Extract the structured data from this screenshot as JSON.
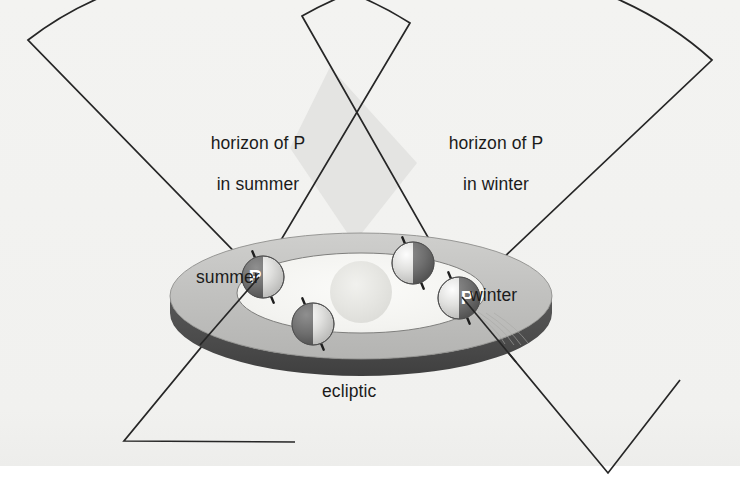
{
  "figure": {
    "background_color": "#f2f2f0",
    "page_color": "#ffffff",
    "line_color": "#262626"
  },
  "labels": {
    "horizon_summer_line1": "horizon of P",
    "horizon_summer_line2": "in summer",
    "horizon_winter_line1": "horizon of P",
    "horizon_winter_line2": "in winter",
    "summer": "summer",
    "winter": "winter",
    "ecliptic": "ecliptic",
    "observer_marker": "P"
  },
  "horizons": [
    {
      "name": "horizon-of-p-in-summer",
      "vertex_x": 259,
      "vertex_y": 277,
      "radius": 332,
      "start_angle_deg": 186,
      "end_angle_deg": 297,
      "fill": "none",
      "stroke": "#262626"
    },
    {
      "name": "horizon-of-p-in-winter",
      "vertex_x": 462,
      "vertex_y": 297,
      "radius": 352,
      "start_angle_deg": 243,
      "end_angle_deg": 355,
      "fill": "none",
      "stroke": "#262626"
    }
  ],
  "overlap_region": {
    "name": "horizon-overlap",
    "fill": "#e2e2e0",
    "stroke": "#262626"
  },
  "ecliptic_disk": {
    "center_x": 361,
    "center_y": 296,
    "radius_x": 191,
    "radius_y": 63,
    "thickness": 17,
    "top_fill": "#bcbcbc",
    "rim_fill": "#4b4b4b",
    "inner_orbit_radius_x": 124,
    "inner_orbit_radius_y": 40,
    "inner_fill": "#f6f6f4"
  },
  "sun": {
    "name": "sun",
    "center_x": 361,
    "center_y": 292,
    "radius": 31,
    "color": "#e3e3e0"
  },
  "earths": [
    {
      "id": "earth-summer",
      "label": "P",
      "has_p_marker": true,
      "p_side": "left",
      "center_x": 263,
      "center_y": 277,
      "radius": 21,
      "lit_side": "right",
      "axis_tilt_deg": 16
    },
    {
      "id": "earth-top",
      "label": "",
      "has_p_marker": false,
      "p_side": "",
      "center_x": 413,
      "center_y": 263,
      "radius": 21,
      "lit_side": "left",
      "axis_tilt_deg": 16
    },
    {
      "id": "earth-winter",
      "label": "P",
      "has_p_marker": true,
      "p_side": "right",
      "center_x": 459,
      "center_y": 298,
      "radius": 21,
      "lit_side": "left",
      "axis_tilt_deg": 16
    },
    {
      "id": "earth-bottom",
      "label": "",
      "has_p_marker": false,
      "p_side": "",
      "center_x": 313,
      "center_y": 324,
      "radius": 21,
      "lit_side": "right",
      "axis_tilt_deg": 16
    }
  ]
}
